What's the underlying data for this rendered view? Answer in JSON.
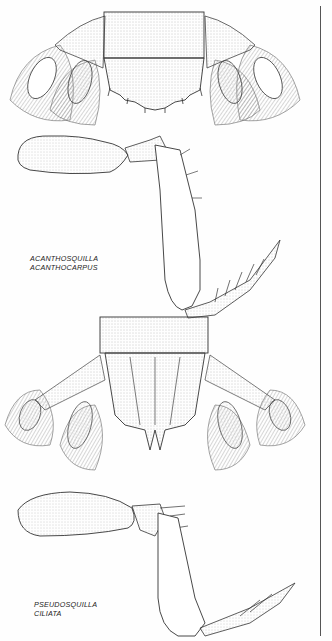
{
  "plate": {
    "figures": [
      {
        "id": "telson-1",
        "description": "Telson and uropods, dorsal view"
      },
      {
        "id": "claw-1",
        "description": "Raptorial claw"
      },
      {
        "id": "telson-2",
        "description": "Telson and uropods, dorsal view"
      },
      {
        "id": "claw-2",
        "description": "Raptorial claw"
      }
    ],
    "captions": [
      {
        "line1": "ACANTHOSQUILLA",
        "line2": "ACANTHOCARPUS"
      },
      {
        "line1": "PSEUDOSQUILLA",
        "line2": "CILIATA"
      }
    ]
  }
}
